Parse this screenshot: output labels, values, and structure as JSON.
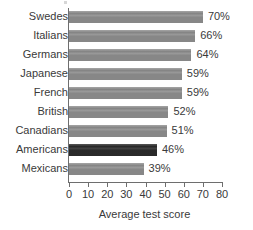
{
  "chart_data": {
    "type": "bar",
    "orientation": "horizontal",
    "title": "",
    "xlabel": "Average test score",
    "ylabel": "",
    "xlim": [
      0,
      80
    ],
    "xticks": [
      0,
      10,
      20,
      30,
      40,
      50,
      60,
      70,
      80
    ],
    "grid": false,
    "legend": false,
    "categories": [
      "Swedes",
      "Italians",
      "Germans",
      "Japanese",
      "French",
      "British",
      "Canadians",
      "Americans",
      "Mexicans"
    ],
    "values": [
      70,
      66,
      64,
      59,
      59,
      52,
      51,
      46,
      39
    ],
    "value_labels": [
      "70%",
      "66%",
      "64%",
      "59%",
      "59%",
      "52%",
      "51%",
      "46%",
      "39%"
    ],
    "highlighted_category": "Americans",
    "bars": [
      {
        "category": "Swedes",
        "value": 70,
        "label": "70%",
        "highlight": false
      },
      {
        "category": "Italians",
        "value": 66,
        "label": "66%",
        "highlight": false
      },
      {
        "category": "Germans",
        "value": 64,
        "label": "64%",
        "highlight": false
      },
      {
        "category": "Japanese",
        "value": 59,
        "label": "59%",
        "highlight": false
      },
      {
        "category": "French",
        "value": 59,
        "label": "59%",
        "highlight": false
      },
      {
        "category": "British",
        "value": 52,
        "label": "52%",
        "highlight": false
      },
      {
        "category": "Canadians",
        "value": 51,
        "label": "51%",
        "highlight": false
      },
      {
        "category": "Americans",
        "value": 46,
        "label": "46%",
        "highlight": true
      },
      {
        "category": "Mexicans",
        "value": 39,
        "label": "39%",
        "highlight": false
      }
    ],
    "colors": {
      "bar": "#8c8c8c",
      "bar_highlight": "#2b2b2b",
      "axis": "#6e6e6e",
      "text": "#3a3a3a",
      "background": "#ffffff"
    }
  }
}
